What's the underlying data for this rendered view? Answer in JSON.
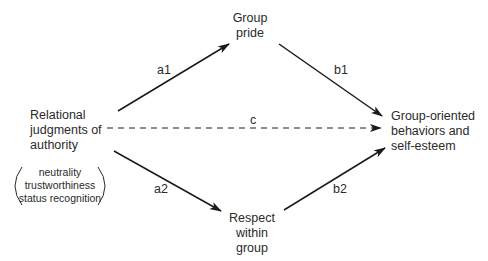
{
  "nodes": {
    "predictor": {
      "lines": [
        "Relational",
        "judgments of",
        "authority"
      ]
    },
    "predictor_components": {
      "lines": [
        "neutrality",
        "trustworthiness",
        "status recognition"
      ]
    },
    "mediator_top": {
      "lines": [
        "Group",
        "pride"
      ]
    },
    "mediator_bottom": {
      "lines": [
        "Respect",
        "within",
        "group"
      ]
    },
    "outcome": {
      "lines": [
        "Group-oriented",
        "behaviors and",
        "self-esteem"
      ]
    }
  },
  "paths": {
    "a1": {
      "label": "a1",
      "from": "predictor",
      "to": "mediator_top",
      "style": "solid"
    },
    "b1": {
      "label": "b1",
      "from": "mediator_top",
      "to": "outcome",
      "style": "solid"
    },
    "c": {
      "label": "c",
      "from": "predictor",
      "to": "outcome",
      "style": "dashed"
    },
    "a2": {
      "label": "a2",
      "from": "predictor",
      "to": "mediator_bottom",
      "style": "solid"
    },
    "b2": {
      "label": "b2",
      "from": "mediator_bottom",
      "to": "outcome",
      "style": "solid"
    }
  },
  "colors": {
    "line": "#1a1a1a",
    "text": "#2a2a2a",
    "background": "#ffffff"
  }
}
